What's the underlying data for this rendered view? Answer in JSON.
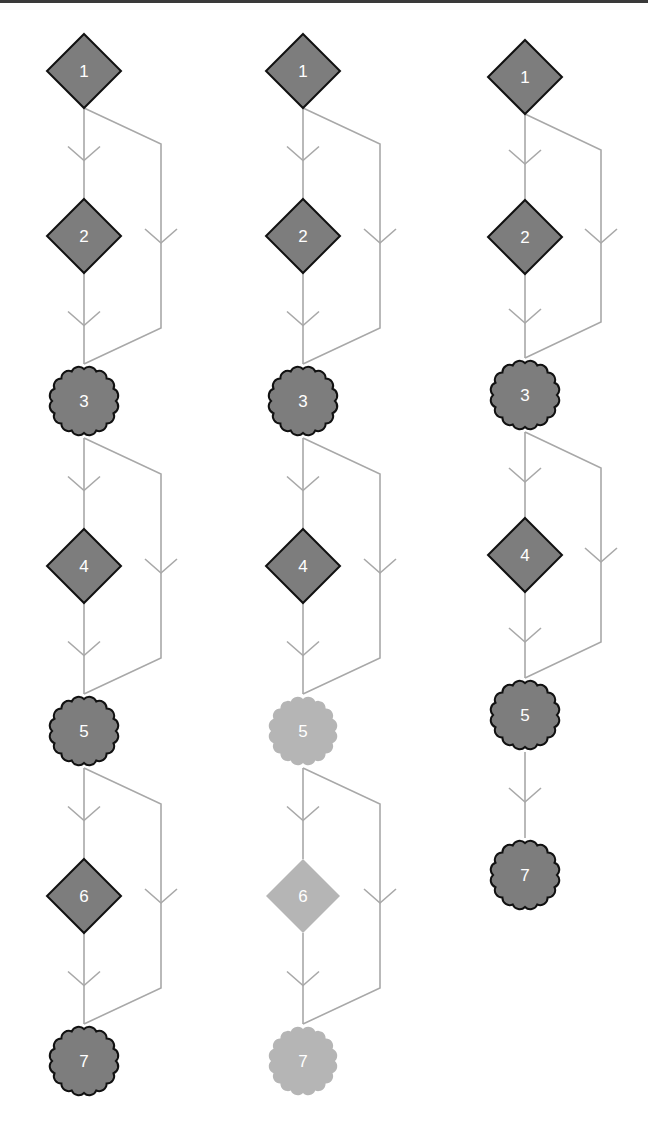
{
  "colors": {
    "node_fill": "#7d7d7d",
    "node_stroke": "#111111",
    "faded_fill": "#b5b5b5",
    "edge": "#a8a8a8",
    "label": "#ffffff",
    "top_rule": "#3a3a3a"
  },
  "node_size": {
    "diamond_half": 37,
    "scallop_radius": 36,
    "scallop_count": 16
  },
  "columns": [
    {
      "id": "column-1",
      "x": 84,
      "bypass_x": 161,
      "nodes": [
        {
          "label": "1",
          "shape": "diamond",
          "y": 71,
          "faded": false
        },
        {
          "label": "2",
          "shape": "diamond",
          "y": 236,
          "faded": false
        },
        {
          "label": "3",
          "shape": "scallop",
          "y": 401,
          "faded": false
        },
        {
          "label": "4",
          "shape": "diamond",
          "y": 566,
          "faded": false
        },
        {
          "label": "5",
          "shape": "scallop",
          "y": 731,
          "faded": false
        },
        {
          "label": "6",
          "shape": "diamond",
          "y": 896,
          "faded": false
        },
        {
          "label": "7",
          "shape": "scallop",
          "y": 1061,
          "faded": false
        }
      ],
      "bypasses": [
        {
          "from": 0,
          "to": 2
        },
        {
          "from": 2,
          "to": 4
        },
        {
          "from": 4,
          "to": 6
        }
      ]
    },
    {
      "id": "column-2",
      "x": 303,
      "bypass_x": 380,
      "nodes": [
        {
          "label": "1",
          "shape": "diamond",
          "y": 71,
          "faded": false
        },
        {
          "label": "2",
          "shape": "diamond",
          "y": 236,
          "faded": false
        },
        {
          "label": "3",
          "shape": "scallop",
          "y": 401,
          "faded": false
        },
        {
          "label": "4",
          "shape": "diamond",
          "y": 566,
          "faded": false
        },
        {
          "label": "5",
          "shape": "scallop",
          "y": 731,
          "faded": true
        },
        {
          "label": "6",
          "shape": "diamond",
          "y": 896,
          "faded": true
        },
        {
          "label": "7",
          "shape": "scallop",
          "y": 1061,
          "faded": true
        }
      ],
      "bypasses": [
        {
          "from": 0,
          "to": 2
        },
        {
          "from": 2,
          "to": 4
        },
        {
          "from": 4,
          "to": 6
        }
      ]
    },
    {
      "id": "column-3",
      "x": 525,
      "bypass_x": 601,
      "nodes": [
        {
          "label": "1",
          "shape": "diamond",
          "y": 77,
          "faded": false
        },
        {
          "label": "2",
          "shape": "diamond",
          "y": 237,
          "faded": false
        },
        {
          "label": "3",
          "shape": "scallop",
          "y": 395,
          "faded": false
        },
        {
          "label": "4",
          "shape": "diamond",
          "y": 555,
          "faded": false
        },
        {
          "label": "5",
          "shape": "scallop",
          "y": 715,
          "faded": false
        },
        {
          "label": "7",
          "shape": "scallop",
          "y": 875,
          "faded": false
        }
      ],
      "bypasses": [
        {
          "from": 0,
          "to": 2
        },
        {
          "from": 2,
          "to": 4
        }
      ]
    }
  ]
}
